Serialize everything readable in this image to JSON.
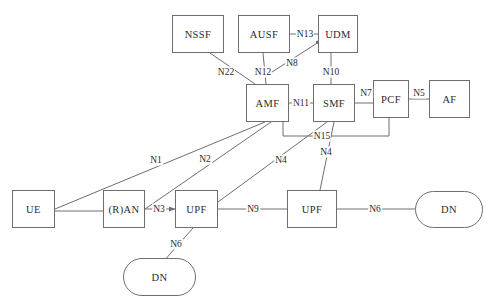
{
  "diagram": {
    "style": {
      "line_color": "#6e6e72",
      "text_color": "#2b2b2b",
      "background": "#ffffff"
    },
    "nodes": [
      {
        "id": "nssf",
        "label": "NSSF",
        "shape": "rect",
        "x": 172,
        "y": 15,
        "w": 52,
        "h": 38
      },
      {
        "id": "ausf",
        "label": "AUSF",
        "shape": "rect",
        "x": 238,
        "y": 15,
        "w": 52,
        "h": 38
      },
      {
        "id": "udm",
        "label": "UDM",
        "shape": "rect",
        "x": 318,
        "y": 15,
        "w": 40,
        "h": 38
      },
      {
        "id": "amf",
        "label": "AMF",
        "shape": "rect",
        "x": 246,
        "y": 84,
        "w": 43,
        "h": 38
      },
      {
        "id": "smf",
        "label": "SMF",
        "shape": "rect",
        "x": 313,
        "y": 84,
        "w": 42,
        "h": 38
      },
      {
        "id": "pcf",
        "label": "PCF",
        "shape": "rect",
        "x": 373,
        "y": 80,
        "w": 36,
        "h": 38
      },
      {
        "id": "af",
        "label": "AF",
        "shape": "rect",
        "x": 429,
        "y": 80,
        "w": 41,
        "h": 38
      },
      {
        "id": "ue",
        "label": "UE",
        "shape": "rect",
        "x": 12,
        "y": 190,
        "w": 43,
        "h": 38
      },
      {
        "id": "ran",
        "label": "(R)AN",
        "shape": "rect",
        "x": 103,
        "y": 190,
        "w": 42,
        "h": 38
      },
      {
        "id": "upf1",
        "label": "UPF",
        "shape": "rect",
        "x": 175,
        "y": 190,
        "w": 43,
        "h": 38
      },
      {
        "id": "upf2",
        "label": "UPF",
        "shape": "rect",
        "x": 287,
        "y": 190,
        "w": 50,
        "h": 38
      },
      {
        "id": "dn1",
        "label": "DN",
        "shape": "pill",
        "x": 123,
        "y": 258,
        "w": 73,
        "h": 38
      },
      {
        "id": "dn2",
        "label": "DN",
        "shape": "pill",
        "x": 415,
        "y": 191,
        "w": 68,
        "h": 37
      }
    ],
    "edges": [
      {
        "id": "n13",
        "label": "N13",
        "label_x": 305,
        "label_y": 34,
        "path": "M 290 34 L 318 34",
        "arrow": false
      },
      {
        "id": "n8",
        "label": "N8",
        "label_x": 292,
        "label_y": 63,
        "path": "M 272 72 L 322 40",
        "arrow": true
      },
      {
        "id": "n22",
        "label": "N22",
        "label_x": 226,
        "label_y": 72,
        "path": "M 210 53 L 255 84",
        "arrow": false
      },
      {
        "id": "n12",
        "label": "N12",
        "label_x": 263,
        "label_y": 72,
        "path": "M 263 53 L 266 84",
        "arrow": false
      },
      {
        "id": "n10",
        "label": "N10",
        "label_x": 331,
        "label_y": 72,
        "path": "M 331 53 L 331 84",
        "arrow": false
      },
      {
        "id": "n11",
        "label": "N11",
        "label_x": 301,
        "label_y": 103,
        "path": "M 289 103 L 313 103",
        "arrow": false
      },
      {
        "id": "n7",
        "label": "N7",
        "label_x": 366,
        "label_y": 93,
        "path": "M 355 103 L 373 103",
        "arrow": false
      },
      {
        "id": "n5",
        "label": "N5",
        "label_x": 419,
        "label_y": 93,
        "path": "M 409 99 L 429 99",
        "arrow": false
      },
      {
        "id": "n15",
        "label": "N15",
        "label_x": 322,
        "label_y": 136,
        "path": "M 283 122 L 283 136 L 389 136 L 389 118",
        "arrow": false
      },
      {
        "id": "n1",
        "label": "N1",
        "label_x": 156,
        "label_y": 160,
        "path": "M 55 209 L 265 122",
        "arrow": false
      },
      {
        "id": "n2",
        "label": "N2",
        "label_x": 205,
        "label_y": 159,
        "path": "M 145 209 L 271 122",
        "arrow": false
      },
      {
        "id": "n3",
        "label": "N3",
        "label_x": 159,
        "label_y": 209,
        "path": "M 145 209 L 175 209",
        "arrow": true
      },
      {
        "id": "n4a",
        "label": "N4",
        "label_x": 281,
        "label_y": 160,
        "path": "M 218 202 L 327 122",
        "arrow": false
      },
      {
        "id": "n4b",
        "label": "N4",
        "label_x": 326,
        "label_y": 152,
        "path": "M 320 190 L 334 122",
        "arrow": false
      },
      {
        "id": "n9",
        "label": "N9",
        "label_x": 253,
        "label_y": 209,
        "path": "M 218 209 L 287 209",
        "arrow": false
      },
      {
        "id": "n6a",
        "label": "N6",
        "label_x": 176,
        "label_y": 244,
        "path": "M 193 228 L 163 262",
        "arrow": false
      },
      {
        "id": "n6b",
        "label": "N6",
        "label_x": 375,
        "label_y": 209,
        "path": "M 337 209 L 415 209",
        "arrow": false
      },
      {
        "id": "ue-ran",
        "label": "",
        "label_x": 0,
        "label_y": 0,
        "path": "M 55 211 L 103 211",
        "arrow": false
      }
    ]
  }
}
